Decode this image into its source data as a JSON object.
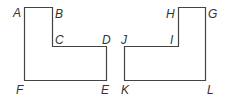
{
  "figures": [
    {
      "name": "left-l-shape",
      "vertices": [
        "A",
        "B",
        "C",
        "D",
        "E",
        "F"
      ]
    },
    {
      "name": "right-l-shape",
      "vertices": [
        "G",
        "H",
        "I",
        "J",
        "K",
        "L"
      ]
    }
  ],
  "labels": {
    "A": "A",
    "B": "B",
    "C": "C",
    "D": "D",
    "E": "E",
    "F": "F",
    "G": "G",
    "H": "H",
    "I": "I",
    "J": "J",
    "K": "K",
    "L": "L"
  },
  "colors": {
    "stroke": "#444444",
    "text": "#333333",
    "background": "#ffffff"
  }
}
